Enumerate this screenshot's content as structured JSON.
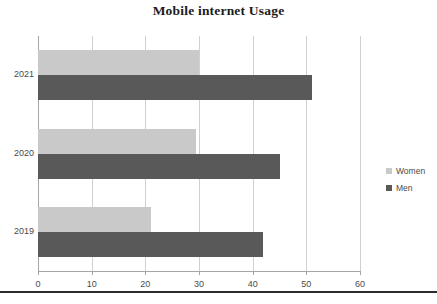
{
  "chart_data": {
    "type": "bar",
    "orientation": "horizontal",
    "title": "Mobile internet Usage",
    "xlabel": "",
    "ylabel": "",
    "categories": [
      "2021",
      "2020",
      "2019"
    ],
    "series": [
      {
        "name": "Women",
        "color": "#c9c9c9",
        "values": [
          30,
          29.5,
          21
        ]
      },
      {
        "name": "Men",
        "color": "#595959",
        "values": [
          51,
          45,
          42
        ]
      }
    ],
    "xlim": [
      0,
      60
    ],
    "xticks": [
      0,
      10,
      20,
      30,
      40,
      50,
      60
    ],
    "xtick_labels": [
      "0",
      "10",
      "20",
      "30",
      "40",
      "50",
      "60"
    ],
    "grid": "vertical",
    "legend_position": "right",
    "legend_entries": [
      "Women",
      "Men"
    ]
  }
}
